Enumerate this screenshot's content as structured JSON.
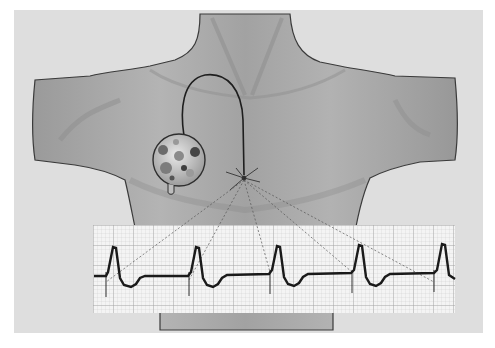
{
  "figure": {
    "colors": {
      "background": "#ffffff",
      "panel": "#dedede",
      "torso": "#a9a9a9",
      "torso_shadow": "#8a8a8a",
      "outline": "#3a3a3a",
      "ecg_paper": "#f4f4f4",
      "ecg_grid_minor": "#c8c8c8",
      "ecg_grid_major": "#9a9a9a",
      "ecg_trace": "#1a1a1a"
    },
    "components": {
      "torso": "torso",
      "pacemaker": "pacemaker-device",
      "lead": "pacing-lead-wire",
      "pacing_site": "pacing-site-spark",
      "ecg_strip": "ecg-strip",
      "connector_lines": "dashed-connector-lines"
    },
    "ecg": {
      "beats": 5,
      "pacing_spike_x": [
        106,
        189,
        270,
        352,
        434
      ],
      "baseline_y": 273,
      "peak_y": 247,
      "trough_y": 288,
      "spike_bottom_y": 297
    }
  }
}
